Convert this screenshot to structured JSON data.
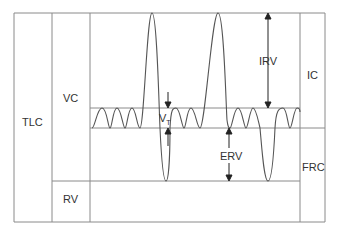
{
  "diagram": {
    "type": "lung volumes spirogram",
    "colors": {
      "line": "#8a8a8a",
      "trace": "#555555",
      "arrow": "#222222",
      "text": "#333333",
      "background": "#ffffff"
    },
    "labels": {
      "tlc": "TLC",
      "vc": "VC",
      "rv": "RV",
      "vt_main": "V",
      "vt_sub": "T",
      "irv": "IRV",
      "erv": "ERV",
      "ic": "IC",
      "frc": "FRC"
    }
  }
}
